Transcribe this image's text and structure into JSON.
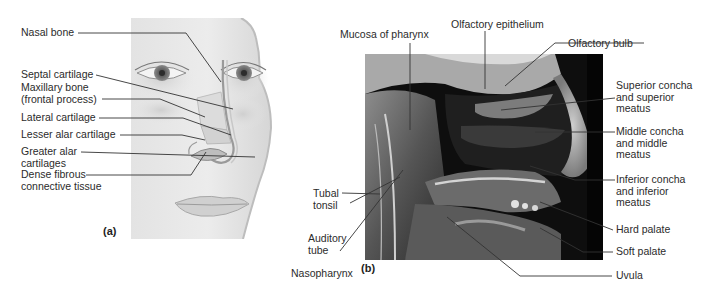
{
  "figure": {
    "panel_a": {
      "letter": "(a)",
      "description": "Illustration of face showing nasal cartilages",
      "labels": [
        {
          "id": "nasal-bone",
          "lines": [
            "Nasal bone"
          ]
        },
        {
          "id": "septal-cartilage",
          "lines": [
            "Septal cartilage"
          ]
        },
        {
          "id": "maxillary-bone",
          "lines": [
            "Maxillary bone",
            "(frontal process)"
          ]
        },
        {
          "id": "lateral-cartilage",
          "lines": [
            "Lateral cartilage"
          ]
        },
        {
          "id": "lesser-alar-cartilage",
          "lines": [
            "Lesser alar cartilage"
          ]
        },
        {
          "id": "greater-alar-cartilages",
          "lines": [
            "Greater alar",
            "cartilages"
          ]
        },
        {
          "id": "dense-fibrous-connective-tissue",
          "lines": [
            "Dense fibrous",
            "connective tissue"
          ]
        }
      ]
    },
    "panel_b": {
      "letter": "(b)",
      "description": "Sagittal dissection photograph of nasal cavity and pharynx",
      "labels": [
        {
          "id": "mucosa-of-pharynx",
          "lines": [
            "Mucosa of pharynx"
          ]
        },
        {
          "id": "olfactory-epithelium",
          "lines": [
            "Olfactory epithelium"
          ]
        },
        {
          "id": "olfactory-bulb",
          "lines": [
            "Olfactory bulb"
          ]
        },
        {
          "id": "superior-concha",
          "lines": [
            "Superior concha",
            "and superior",
            "meatus"
          ]
        },
        {
          "id": "middle-concha",
          "lines": [
            "Middle concha",
            "and middle",
            "meatus"
          ]
        },
        {
          "id": "inferior-concha",
          "lines": [
            "Inferior concha",
            "and inferior",
            "meatus"
          ]
        },
        {
          "id": "hard-palate",
          "lines": [
            "Hard palate"
          ]
        },
        {
          "id": "soft-palate",
          "lines": [
            "Soft palate"
          ]
        },
        {
          "id": "uvula",
          "lines": [
            "Uvula"
          ]
        },
        {
          "id": "tubal-tonsil",
          "lines": [
            "Tubal",
            "tonsil"
          ]
        },
        {
          "id": "auditory-tube",
          "lines": [
            "Auditory",
            "tube"
          ]
        },
        {
          "id": "nasopharynx",
          "lines": [
            "Nasopharynx"
          ]
        }
      ]
    }
  }
}
